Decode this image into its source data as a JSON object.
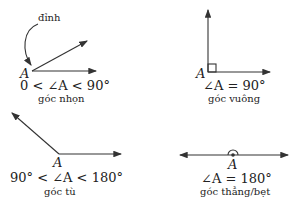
{
  "panels": [
    {
      "id": "acute",
      "vertex": "A",
      "relation": "0 < ∠A < 90°",
      "name": "góc nhọn",
      "annotation": "đỉnh"
    },
    {
      "id": "right",
      "vertex": "A",
      "relation": "∠A = 90°",
      "name": "góc vuông"
    },
    {
      "id": "obtuse",
      "vertex": "A",
      "relation": "90° < ∠A < 180°",
      "name": "góc tù"
    },
    {
      "id": "straight",
      "vertex": "A",
      "relation": "∠A = 180°",
      "name": "góc thẳng/bẹt"
    }
  ],
  "colors": {
    "stroke": "#333333",
    "text": "#222222"
  }
}
